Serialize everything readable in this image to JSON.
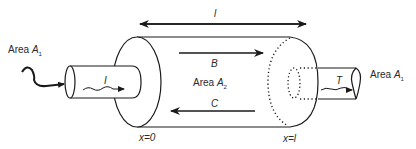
{
  "diagram": {
    "type": "transmission-line-cylinder",
    "labels": {
      "length_top": "l",
      "area_left_prefix": "Area ",
      "area_left_symbol": "A",
      "area_left_sub": "1",
      "area_right_prefix": "Area ",
      "area_right_symbol": "A",
      "area_right_sub": "1",
      "area_middle_prefix": "Area ",
      "area_middle_symbol": "A",
      "area_middle_sub": "2",
      "incident_wave": "I",
      "transmitted_wave": "T",
      "forward_wave": "B",
      "backward_wave": "C",
      "x_start": "x=0",
      "x_end": "x=l"
    },
    "colors": {
      "stroke": "#1a1a1a",
      "text": "#2a2a2a",
      "background": "#ffffff"
    }
  }
}
